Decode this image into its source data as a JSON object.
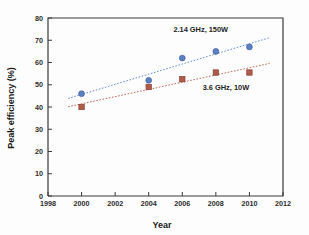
{
  "chart_data": {
    "type": "scatter",
    "title": "",
    "xlabel": "Year",
    "ylabel": "Peak efficiency (%)",
    "xlim": [
      1998,
      2012
    ],
    "ylim": [
      0,
      80
    ],
    "xticks": [
      1998,
      2000,
      2002,
      2004,
      2006,
      2008,
      2010,
      2012
    ],
    "yticks": [
      0,
      10,
      20,
      30,
      40,
      50,
      60,
      70,
      80
    ],
    "grid": false,
    "legend_position": "inline-annotation",
    "series": [
      {
        "name": "2.14 GHz, 150W",
        "marker": "circle",
        "color": "#5b7fc4",
        "trendline": true,
        "trendline_style": "dotted",
        "x": [
          2000,
          2004,
          2006,
          2008,
          2010
        ],
        "values": [
          46,
          52,
          62,
          65,
          67
        ]
      },
      {
        "name": "3.6 GHz, 10W",
        "marker": "square",
        "color": "#b05a4a",
        "trendline": true,
        "trendline_style": "dotted",
        "x": [
          2000,
          2004,
          2006,
          2008,
          2010
        ],
        "values": [
          40,
          49,
          52.5,
          55.5,
          55.5
        ]
      }
    ],
    "annotations": [
      {
        "text": "2.14 GHz, 150W",
        "x": 2007.1,
        "y": 73.5
      },
      {
        "text": "3.6 GHz, 10W",
        "x": 2008.6,
        "y": 47.5
      }
    ]
  },
  "axes": {
    "x_title": "Year",
    "y_title": "Peak efficiency (%)",
    "x_tick_labels": [
      "1998",
      "2000",
      "2002",
      "2004",
      "2006",
      "2008",
      "2010",
      "2012"
    ],
    "y_tick_labels": [
      "0",
      "10",
      "20",
      "30",
      "40",
      "50",
      "60",
      "70",
      "80"
    ]
  },
  "colors": {
    "series_blue": "#5b7fc4",
    "series_red": "#b05a4a",
    "axis": "#3a3a3a",
    "background": "#fdfdfd"
  }
}
